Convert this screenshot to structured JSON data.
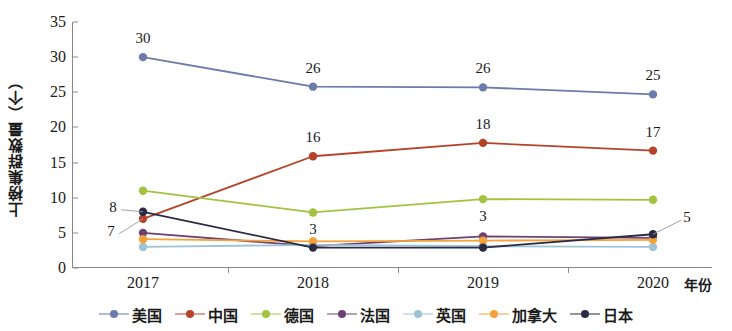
{
  "chart_data": {
    "type": "line",
    "title": "",
    "xlabel": "年份",
    "ylabel": "上榜集群数量（个）",
    "categories": [
      "2017",
      "2018",
      "2019",
      "2020"
    ],
    "xticklabels": [
      "2017",
      "2018",
      "2019",
      "2020"
    ],
    "yticklabels": [
      "0",
      "5",
      "10",
      "15",
      "20",
      "25",
      "30",
      "35"
    ],
    "ylim": [
      0,
      35
    ],
    "ytick_step": 5,
    "grid": false,
    "legend_position": "bottom",
    "series": [
      {
        "name": "美国",
        "color": "#6b7bab",
        "values": [
          30.0,
          25.8,
          25.7,
          24.7
        ]
      },
      {
        "name": "中国",
        "color": "#b5432a",
        "values": [
          7.0,
          15.9,
          17.8,
          16.7
        ]
      },
      {
        "name": "德国",
        "color": "#a3c23f",
        "values": [
          11.0,
          7.9,
          9.8,
          9.7
        ]
      },
      {
        "name": "法国",
        "color": "#6e4270",
        "values": [
          5.0,
          3.1,
          4.5,
          4.3
        ]
      },
      {
        "name": "英国",
        "color": "#9dc3d4",
        "values": [
          3.0,
          3.3,
          3.1,
          3.0
        ]
      },
      {
        "name": "加拿大",
        "color": "#f5a23c",
        "values": [
          4.1,
          3.8,
          3.9,
          4.0
        ]
      },
      {
        "name": "日本",
        "color": "#2b2b45",
        "values": [
          8.0,
          2.9,
          2.9,
          4.8
        ]
      }
    ],
    "annotations": [
      {
        "text": "30",
        "series": "美国",
        "category": "2017",
        "value": 30
      },
      {
        "text": "26",
        "series": "美国",
        "category": "2018",
        "value": 26
      },
      {
        "text": "26",
        "series": "美国",
        "category": "2019",
        "value": 26
      },
      {
        "text": "25",
        "series": "美国",
        "category": "2020",
        "value": 25
      },
      {
        "text": "16",
        "series": "中国",
        "category": "2018",
        "value": 16
      },
      {
        "text": "18",
        "series": "中国",
        "category": "2019",
        "value": 18
      },
      {
        "text": "17",
        "series": "中国",
        "category": "2020",
        "value": 17
      },
      {
        "text": "8",
        "series": "日本",
        "category": "2017",
        "value": 8
      },
      {
        "text": "7",
        "series": "中国",
        "category": "2017",
        "value": 7
      },
      {
        "text": "3",
        "series": "日本",
        "category": "2018",
        "value": 3
      },
      {
        "text": "3",
        "series": "法国",
        "category": "2019",
        "value": 3
      },
      {
        "text": "5",
        "series": "日本",
        "category": "2020",
        "value": 5
      }
    ]
  }
}
